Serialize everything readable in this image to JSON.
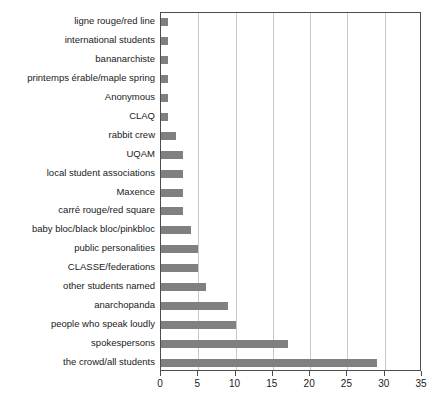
{
  "chart_data": {
    "type": "bar",
    "orientation": "horizontal",
    "title": "",
    "subtitle": "",
    "xlabel": "",
    "ylabel": "",
    "xlim": [
      0,
      35
    ],
    "ylim": null,
    "grid": true,
    "legend": null,
    "legend_position": "none",
    "bar_color": "#808080",
    "axis_color": "#4d4d4d",
    "gridline_color": "#c9c9c9",
    "xticks": [
      0,
      5,
      10,
      15,
      20,
      25,
      30,
      35
    ],
    "xtick_labels": [
      "0",
      "5",
      "10",
      "15",
      "20",
      "25",
      "30",
      "35"
    ],
    "categories": [
      "ligne rouge/red line",
      "international students",
      "bananarchiste",
      "printemps érable/maple spring",
      "Anonymous",
      "CLAQ",
      "rabbit crew",
      "UQAM",
      "local student associations",
      "Maxence",
      "carré rouge/red square",
      "baby bloc/black bloc/pinkbloc",
      "public personalities",
      "CLASSE/federations",
      "other students named",
      "anarchopanda",
      "people who speak loudly",
      "spokespersons",
      "the crowd/all students"
    ],
    "values": [
      1,
      1,
      1,
      1,
      1,
      1,
      2,
      3,
      3,
      3,
      3,
      4,
      5,
      5,
      6,
      9,
      10,
      17,
      29
    ]
  }
}
